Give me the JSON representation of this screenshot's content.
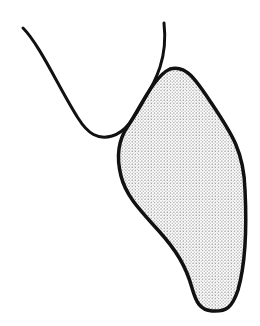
{
  "figure": {
    "kind": "line-drawing",
    "background": "#ffffff",
    "stroke_color": "#111111",
    "shapes": [
      {
        "id": "open-curve",
        "label": "U-shaped outline curve",
        "fill": "none",
        "stroke_width": 3,
        "path": "M 23 28 C 40 45, 60 90, 78 118 C 88 134, 98 140, 112 136 C 126 132, 134 118, 144 100 C 156 80, 168 58, 164 23"
      },
      {
        "id": "stippled-blob",
        "label": "Stippled (dotted) filled shape",
        "fill_pattern": "dots",
        "dot_color": "#9a9a9a",
        "stroke_width": 3.5,
        "path": "M 170 69 C 186 64, 196 80, 212 104 C 232 134, 244 152, 245 190 C 247 230, 246 262, 238 290 C 232 308, 226 312, 212 311 C 200 310, 196 302, 192 288 C 186 266, 176 250, 158 230 C 140 210, 126 196, 121 176 C 116 156, 118 140, 128 126 C 140 108, 154 76, 170 69 Z"
      }
    ]
  }
}
